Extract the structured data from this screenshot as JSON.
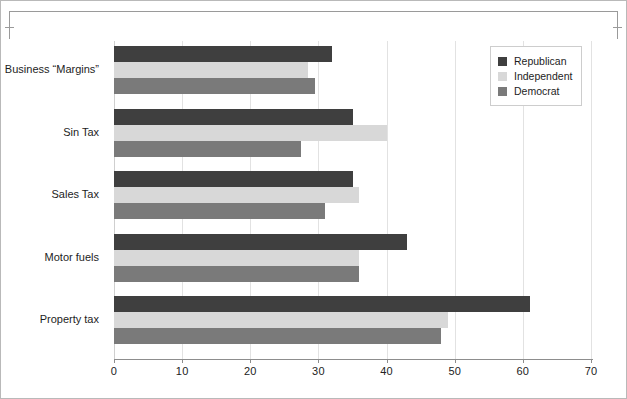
{
  "chart_data": {
    "type": "bar",
    "orientation": "horizontal",
    "title": "",
    "subtitle": "",
    "xlabel": "",
    "ylabel": "",
    "xlim": [
      0,
      70
    ],
    "xticks": [
      0,
      10,
      20,
      30,
      40,
      50,
      60,
      70
    ],
    "xtick_labels": [
      "0",
      "10",
      "20",
      "30",
      "40",
      "50",
      "60",
      "70"
    ],
    "grid": true,
    "grid_axis": "x",
    "legend_position": "top-right",
    "categories": [
      "Business “Margins”",
      "Sin Tax",
      "Sales Tax",
      "Motor fuels",
      "Property tax"
    ],
    "series": [
      {
        "name": "Republican",
        "color": "#3f3f3f",
        "values": [
          32,
          35,
          35,
          43,
          61
        ]
      },
      {
        "name": "Independent",
        "color": "#d8d8d8",
        "values": [
          28.5,
          40,
          36,
          36,
          49
        ]
      },
      {
        "name": "Democrat",
        "color": "#7a7a7a",
        "values": [
          29.5,
          27.5,
          31,
          36,
          48
        ]
      }
    ]
  },
  "legend": {
    "items": [
      {
        "label": "Republican",
        "swatch": "rep"
      },
      {
        "label": "Independent",
        "swatch": "ind"
      },
      {
        "label": "Democrat",
        "swatch": "dem"
      }
    ]
  },
  "colors": {
    "republican": "#3f3f3f",
    "independent": "#d8d8d8",
    "democrat": "#7a7a7a",
    "grid": "#e2e2e2",
    "axis": "#8d8d8d",
    "bracket": "#9a9a9a",
    "text": "#1d1d1d"
  }
}
